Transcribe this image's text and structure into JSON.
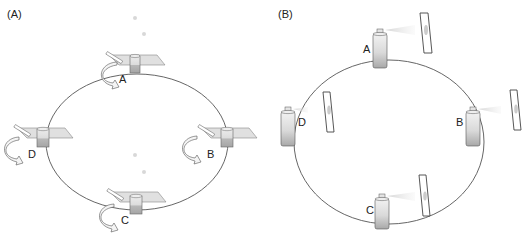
{
  "panels": [
    {
      "id": "A",
      "label": "(A)",
      "stations": [
        {
          "label": "A"
        },
        {
          "label": "B"
        },
        {
          "label": "C"
        },
        {
          "label": "D"
        }
      ],
      "description": "Containers on tilted plates around an elliptical track, each with a curved rotation arrow"
    },
    {
      "id": "B",
      "label": "(B)",
      "stations": [
        {
          "label": "A"
        },
        {
          "label": "B"
        },
        {
          "label": "C"
        },
        {
          "label": "D"
        }
      ],
      "description": "Spray cans around an elliptical track, each spraying toward an upright panel"
    }
  ],
  "colors": {
    "line": "#555555",
    "plate": "#d6d6d6",
    "can_body": "#cfcfcf",
    "spray": "#d9d9d9"
  }
}
